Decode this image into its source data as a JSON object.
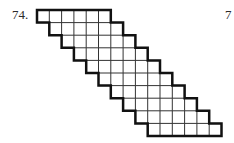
{
  "problem": {
    "number_label": "74.",
    "page_marker": "7"
  },
  "figure": {
    "type": "staircase-grid-band",
    "rows": 10,
    "cells_per_row": 6,
    "row_shift_cells": 1,
    "origin": {
      "x": 37,
      "y": 10
    },
    "cell_width": 12.3,
    "cell_height": 12.6,
    "grid_line_color": "#333333",
    "outline_color": "#111111",
    "grid_line_width": 1,
    "outline_width": 2.5
  }
}
